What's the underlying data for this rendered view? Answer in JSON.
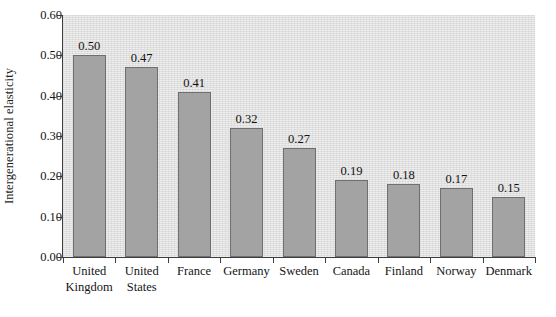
{
  "chart_data": {
    "type": "bar",
    "title": "",
    "subtitle": "",
    "xlabel": "",
    "ylabel": "Intergenerational elasticity",
    "ylim": [
      0.0,
      0.6
    ],
    "ytick_labels": [
      "0.60",
      "0.50",
      "0.40",
      "0.30",
      "0.20",
      "0.10",
      "0.00"
    ],
    "ytick_values": [
      0.6,
      0.5,
      0.4,
      0.3,
      0.2,
      0.1,
      0.0
    ],
    "grid": false,
    "legend": null,
    "legend_position": "none",
    "orientation": "vertical",
    "categories": [
      "United Kingdom",
      "United States",
      "France",
      "Germany",
      "Sweden",
      "Canada",
      "Finland",
      "Norway",
      "Denmark"
    ],
    "category_lines": [
      [
        "United",
        "Kingdom"
      ],
      [
        "United",
        "States"
      ],
      [
        "France"
      ],
      [
        "Germany"
      ],
      [
        "Sweden"
      ],
      [
        "Canada"
      ],
      [
        "Finland"
      ],
      [
        "Norway"
      ],
      [
        "Denmark"
      ]
    ],
    "values": [
      0.5,
      0.47,
      0.41,
      0.32,
      0.27,
      0.19,
      0.18,
      0.17,
      0.15
    ],
    "value_labels": [
      "0.50",
      "0.47",
      "0.41",
      "0.32",
      "0.27",
      "0.19",
      "0.18",
      "0.17",
      "0.15"
    ],
    "colors": {
      "bar_fill": "#a3a3a3",
      "bar_edge": "#6f6f6f",
      "plot_background": "#dcdcdc",
      "figure_background": "#ffffff",
      "axis": "#3d3d3d",
      "text": "#141414"
    }
  }
}
